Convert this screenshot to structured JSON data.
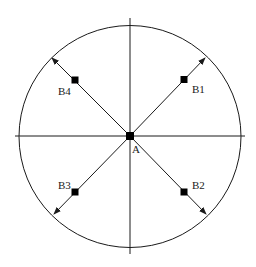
{
  "diagram": {
    "center": {
      "label": "A",
      "x": 130,
      "y": 136
    },
    "circle": {
      "cx": 130,
      "cy": 136.5,
      "r": 111
    },
    "axes": {
      "horizontal": {
        "x1": 15,
        "x2": 245,
        "y": 136
      },
      "vertical": {
        "x": 130,
        "y1": 18,
        "y2": 254
      }
    },
    "points": [
      {
        "id": "B1",
        "label": "B1",
        "x": 184,
        "y": 80,
        "label_x": 192,
        "label_y": 93,
        "arrow_x": 205,
        "arrow_y": 58
      },
      {
        "id": "B2",
        "label": "B2",
        "x": 184,
        "y": 192,
        "label_x": 192,
        "label_y": 189,
        "arrow_x": 206,
        "arrow_y": 214
      },
      {
        "id": "B3",
        "label": "B3",
        "x": 75,
        "y": 192,
        "label_x": 58,
        "label_y": 189,
        "arrow_x": 54,
        "arrow_y": 214
      },
      {
        "id": "B4",
        "label": "B4",
        "x": 75,
        "y": 80,
        "label_x": 58,
        "label_y": 95,
        "arrow_x": 52,
        "arrow_y": 58
      }
    ],
    "colors": {
      "stroke": "#1a1a1a",
      "marker": "#000000",
      "background": "#ffffff"
    }
  }
}
